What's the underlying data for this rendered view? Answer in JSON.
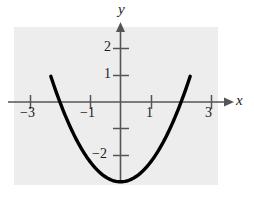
{
  "figure": {
    "name": "parabola-graph",
    "background_color": "#ffffff",
    "plot_background_color": "#ededed",
    "curve_color": "#000000",
    "axis_color": "#555555"
  },
  "axes": {
    "x_label": "x",
    "y_label": "y",
    "x_ticks": [
      {
        "value": -3,
        "label": "−3"
      },
      {
        "value": -1,
        "label": "−1"
      },
      {
        "value": 1,
        "label": "1"
      },
      {
        "value": 3,
        "label": "3"
      }
    ],
    "y_ticks": [
      {
        "value": 2,
        "label": "2"
      },
      {
        "value": 1,
        "label": "1"
      },
      {
        "value": -1,
        "label": ""
      },
      {
        "value": -2,
        "label": "−2"
      }
    ],
    "x_unlabeled_ticks": [],
    "y_unlabeled_ticks": [
      -1
    ]
  },
  "chart_data": {
    "type": "line",
    "title": "",
    "subtitle": "",
    "xlabel": "x",
    "ylabel": "y",
    "xlim": [
      -3.5,
      3.3
    ],
    "ylim": [
      -3.6,
      2.8
    ],
    "grid": false,
    "legend": null,
    "annotations": [],
    "series": [
      {
        "name": "parabola",
        "equation": "y = 0.75x^2 - 3",
        "color": "#000000",
        "vertex": [
          0,
          -3
        ],
        "roots": [
          -2,
          2
        ],
        "x": [
          -2.25,
          -2.0,
          -1.75,
          -1.5,
          -1.25,
          -1.0,
          -0.75,
          -0.5,
          -0.25,
          0,
          0.25,
          0.5,
          0.75,
          1.0,
          1.25,
          1.5,
          1.75,
          2.0,
          2.25
        ],
        "values": [
          0.8,
          0.0,
          -0.7,
          -1.31,
          -1.83,
          -2.25,
          -2.58,
          -2.81,
          -2.95,
          -3.0,
          -2.95,
          -2.81,
          -2.58,
          -2.25,
          -1.83,
          -1.31,
          -0.7,
          0.0,
          0.8
        ]
      }
    ]
  }
}
